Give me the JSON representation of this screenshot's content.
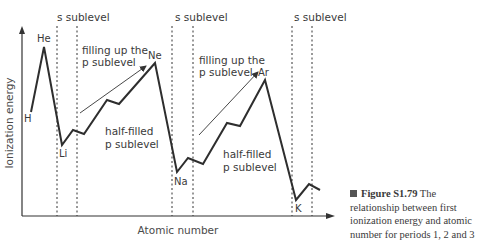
{
  "chart_data": {
    "type": "line",
    "title": "",
    "xlabel": "Atomic number",
    "ylabel": "Ionization energy",
    "grid": false,
    "legend": null,
    "series": [
      {
        "name": "First ionization energy",
        "x": [
          1,
          2,
          3,
          4,
          5,
          6,
          7,
          8,
          9,
          10,
          11,
          12,
          13,
          14,
          15,
          16,
          17,
          18,
          19,
          20,
          21
        ],
        "points_label": [
          "H",
          "He",
          "Li",
          "",
          "",
          "",
          "",
          "",
          "",
          "Ne",
          "Na",
          "",
          "",
          "",
          "",
          "",
          "",
          "Ar",
          "K",
          "",
          ""
        ],
        "px": [
          [
            31,
            112
          ],
          [
            44,
            47
          ],
          [
            62,
            145
          ],
          [
            73,
            130
          ],
          [
            84,
            134
          ],
          [
            107,
            100
          ],
          [
            119,
            104
          ],
          [
            155,
            63
          ],
          [
            177,
            172
          ],
          [
            188,
            158
          ],
          [
            203,
            164
          ],
          [
            227,
            123
          ],
          [
            240,
            126
          ],
          [
            265,
            80
          ],
          [
            296,
            200
          ],
          [
            309,
            184
          ],
          [
            320,
            190
          ]
        ]
      }
    ],
    "annotations": {
      "element_labels": [
        {
          "text": "H",
          "x": 24,
          "y": 122
        },
        {
          "text": "He",
          "x": 37,
          "y": 42
        },
        {
          "text": "Li",
          "x": 59,
          "y": 157
        },
        {
          "text": "Ne",
          "x": 148,
          "y": 59
        },
        {
          "text": "Na",
          "x": 174,
          "y": 185
        },
        {
          "text": "Ar",
          "x": 258,
          "y": 76
        },
        {
          "text": "K",
          "x": 295,
          "y": 212
        }
      ],
      "sublevel_labels": [
        {
          "text": "s sublevel",
          "x": 57,
          "y": 21
        },
        {
          "text": "s sublevel",
          "x": 175,
          "y": 21
        },
        {
          "text": "s sublevel",
          "x": 294,
          "y": 21
        }
      ],
      "filling_labels": [
        {
          "line1": "filling up the",
          "line2": "p sublevel",
          "x": 82,
          "y": 54
        },
        {
          "line1": "filling up the",
          "line2": "p sublevel",
          "x": 199,
          "y": 64
        }
      ],
      "half_filled_labels": [
        {
          "line1": "half-filled",
          "line2": "p sublevel",
          "x": 105,
          "y": 135
        },
        {
          "line1": "half-filled",
          "line2": "p sublevel",
          "x": 223,
          "y": 158
        }
      ],
      "dotted_lines_x": [
        57,
        77,
        172,
        193,
        292,
        312
      ],
      "arrows": [
        {
          "x1": 80,
          "y1": 113,
          "x2": 146,
          "y2": 66
        },
        {
          "x1": 199,
          "y1": 135,
          "x2": 258,
          "y2": 72
        }
      ]
    }
  },
  "axes": {
    "x_label": "Atomic number",
    "y_label": "Ionization energy"
  },
  "caption": {
    "figure": "Figure S1.79",
    "text": "The relationship between first ionization energy and atomic number for periods 1, 2 and 3",
    "line1_rest": "The",
    "line2": "relationship between first",
    "line3": "ionization energy and atomic",
    "line4": "number for periods 1, 2 and 3"
  }
}
